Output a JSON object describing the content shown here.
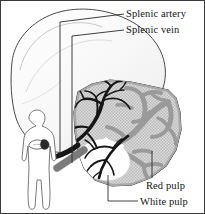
{
  "figure": {
    "width": 205,
    "height": 214,
    "background_color": "#ffffff",
    "border_color": "#3a3a3a"
  },
  "labels": {
    "splenic_artery": "Splenic artery",
    "splenic_vein": "Splenic vein",
    "red_pulp": "Red pulp",
    "white_pulp": "White pulp"
  },
  "structures": {
    "whole_spleen_outline": "whole-spleen-outline",
    "cross_section": "spleen-cross-section",
    "artery_tree": "splenic-artery-branching-tree",
    "vein_tree": "splenic-vein-branching-tree",
    "vein_trunk": "splenic-vein-trunk",
    "artery_trunk": "splenic-artery-trunk",
    "white_pulp_region": "white-pulp-region",
    "red_pulp_region": "red-pulp-region",
    "body_silhouette": "human-body-silhouette",
    "body_spleen_marker": "body-spleen-location-marker",
    "body_stomach_outline": "body-stomach-outline"
  },
  "colors": {
    "outline": "#3d3d3d",
    "artery_dark": "#1b1b1b",
    "vein_gray": "#8d8d8d",
    "red_pulp_fill": "#d6d6d6",
    "red_pulp_stipple": "#b4b4b4",
    "sinus_gray": "#9a9a9a",
    "white_pulp_fill": "#ffffff",
    "whole_spleen_fill": "#fbfbfb",
    "whole_spleen_shade": "#ededed",
    "leader_line": "#2a2a2a",
    "text": "#141414"
  },
  "leader_lines": {
    "splenic_artery": "vertical-leader-from-artery-trunk-to-label",
    "splenic_vein": "vertical-leader-from-vein-trunk-to-label",
    "red_pulp": "short-leader-from-red-pulp-tissue-to-label",
    "white_pulp": "leader-from-white-pulp-region-to-label"
  }
}
